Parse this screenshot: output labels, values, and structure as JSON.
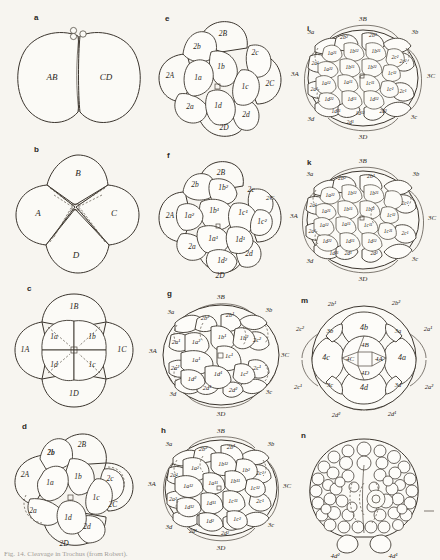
{
  "figure": {
    "caption": "Fig. 14. Cleavage in Trochus (from Robert).",
    "background_color": "#f7f5f0",
    "ink_color": "#2b2823",
    "panel_letters": [
      "a",
      "b",
      "c",
      "d",
      "e",
      "f",
      "g",
      "h",
      "i",
      "k",
      "m",
      "n"
    ]
  },
  "panels": {
    "a": {
      "letter": "a",
      "description": "two-cell stage",
      "labels": [
        "AB",
        "CD"
      ],
      "polar_bodies": 2
    },
    "b": {
      "letter": "b",
      "description": "four-cell stage",
      "labels": [
        "A",
        "B",
        "C",
        "D"
      ]
    },
    "c": {
      "letter": "c",
      "description": "eight-cell stage",
      "macromeres": [
        "1A",
        "1B",
        "1C",
        "1D"
      ],
      "micromeres": [
        "1a",
        "1b",
        "1c",
        "1d"
      ]
    },
    "d": {
      "letter": "d",
      "description": "twelve-cell stage, oblique view",
      "macromeres": [
        "2A",
        "2B",
        "2C",
        "2D"
      ],
      "micromeres": [
        "1a",
        "1b",
        "1c",
        "1d",
        "2a",
        "2b",
        "2c",
        "2d"
      ]
    },
    "e": {
      "letter": "e",
      "description": "twelve-cell stage, animal pole view",
      "macromeres": [
        "2A",
        "2B",
        "2C",
        "2D"
      ],
      "micromeres": [
        "1a",
        "1b",
        "1c",
        "1d",
        "2a",
        "2b",
        "2c",
        "2d"
      ]
    },
    "f": {
      "letter": "f",
      "description": "twenty-cell stage",
      "macromeres": [
        "2A",
        "2B",
        "2C",
        "2D"
      ],
      "micromeres": [
        "2a",
        "2b",
        "2c",
        "2d"
      ],
      "quartet_cells": [
        "1a¹",
        "1a²",
        "1b¹",
        "1b²",
        "1c¹",
        "1c²",
        "1d¹",
        "1d²"
      ]
    },
    "g": {
      "letter": "g",
      "description": "later cleavage stage",
      "macromeres": [
        "3A",
        "3B",
        "3C",
        "3D"
      ],
      "micromeres": [
        "3a",
        "3b",
        "3c",
        "3d"
      ],
      "second_quartet": [
        "2a¹",
        "2a²",
        "2b¹",
        "2b²",
        "2c¹",
        "2c²",
        "2d¹",
        "2d²"
      ],
      "first_quartet": [
        "1a¹",
        "1a²",
        "1b¹",
        "1b²",
        "1c¹",
        "1c²",
        "1d¹",
        "1d²"
      ]
    },
    "h": {
      "letter": "h",
      "description": "further subdivided stage",
      "macromeres": [
        "3A",
        "3B",
        "3C",
        "3D"
      ],
      "micromeres": [
        "3a",
        "3b",
        "3c",
        "3d"
      ],
      "second_quartet": [
        "2a¹",
        "2a²",
        "2b¹",
        "2b²",
        "2c¹",
        "2c²",
        "2d¹",
        "2d²"
      ],
      "first_quartet": [
        "1a¹¹",
        "1a¹²",
        "1a²",
        "1b¹¹",
        "1b¹²",
        "1b²",
        "1c¹¹",
        "1c¹²",
        "1c²",
        "1d¹¹",
        "1d¹²",
        "1d²"
      ]
    },
    "i": {
      "letter": "i",
      "description": "advanced cleavage, animal pole view",
      "macromeres": [
        "3A",
        "3B",
        "3C",
        "3D"
      ],
      "micromeres": [
        "3a",
        "3b",
        "3c",
        "3d"
      ],
      "second_quartet": [
        "2a¹",
        "2a²",
        "2b¹",
        "2b²",
        "2c¹",
        "2c²",
        "2d¹",
        "2d²"
      ],
      "first_quartet": [
        "1a¹¹",
        "1a¹²",
        "1a²¹",
        "1a²²",
        "1b¹¹",
        "1b¹²",
        "1b²¹",
        "1b²²",
        "1c¹¹",
        "1c¹²",
        "1c²",
        "1d¹¹",
        "1d¹²",
        "1d²¹",
        "1d²²"
      ]
    },
    "k": {
      "letter": "k",
      "description": "still later cleavage, animal pole view",
      "macromeres": [
        "3A",
        "3B",
        "3C",
        "3D"
      ],
      "micromeres": [
        "3a",
        "3b",
        "3c",
        "3d"
      ],
      "second_quartet": [
        "2a¹",
        "2a²",
        "2b¹",
        "2b²",
        "2c¹",
        "2c²",
        "2d¹",
        "2d²"
      ],
      "first_quartet": [
        "1a¹¹",
        "1a¹²",
        "1a²¹",
        "1a²²",
        "1b¹¹",
        "1b¹²",
        "1b²¹",
        "1b²²",
        "1c¹¹",
        "1c¹²",
        "1c²¹",
        "1d¹¹",
        "1d¹²",
        "1d²¹",
        "1d²²"
      ]
    },
    "m": {
      "letter": "m",
      "description": "vegetal pole view",
      "central": [
        "4A",
        "4B",
        "4C",
        "4D"
      ],
      "fourth_quartet": [
        "4a",
        "4b",
        "4c",
        "4d"
      ],
      "third_quartet": [
        "3a",
        "3b",
        "3c",
        "3d"
      ],
      "second_quartet": [
        "2a¹",
        "2a²",
        "2b¹",
        "2b²",
        "2c¹",
        "2c²",
        "2d¹",
        "2d²"
      ]
    },
    "n": {
      "letter": "n",
      "description": "blastula with numerous small cells",
      "labels": [
        "4d¹",
        "4d²"
      ]
    }
  }
}
